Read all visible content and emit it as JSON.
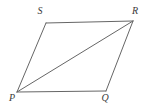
{
  "figure": {
    "type": "geometry-diagram",
    "shape_name": "parallelogram",
    "background_color": "#ffffff",
    "stroke_color": "#666666",
    "stroke_width": 1,
    "label_color": "#3a3a3a",
    "label_font_size": 10,
    "canvas": {
      "width": 146,
      "height": 108
    },
    "vertices": [
      {
        "id": "S",
        "label": "S",
        "x": 46,
        "y": 23,
        "label_x": 40,
        "label_y": 12
      },
      {
        "id": "R",
        "label": "R",
        "x": 133,
        "y": 21,
        "label_x": 135,
        "label_y": 12
      },
      {
        "id": "Q",
        "label": "Q",
        "x": 106,
        "y": 91,
        "label_x": 105,
        "label_y": 99
      },
      {
        "id": "P",
        "label": "P",
        "x": 17,
        "y": 92,
        "label_x": 12,
        "label_y": 99
      }
    ],
    "edges": [
      {
        "id": "SR",
        "from": "S",
        "to": "R",
        "points": "46,23 133,21"
      },
      {
        "id": "RQ",
        "from": "R",
        "to": "Q",
        "points": "133,21 106,91"
      },
      {
        "id": "QP",
        "from": "Q",
        "to": "P",
        "points": "106,91 17,92"
      },
      {
        "id": "PS",
        "from": "P",
        "to": "S",
        "points": "17,92 46,23"
      }
    ],
    "diagonals": [
      {
        "id": "PR",
        "from": "P",
        "to": "R",
        "points": "17,92 133,21"
      }
    ],
    "outline_points": "46,23 133,21 106,91 17,92"
  }
}
